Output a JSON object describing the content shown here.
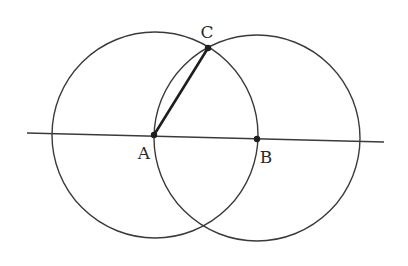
{
  "diagram": {
    "type": "geometric-construction",
    "stroke_color": "#3a3a3a",
    "background": "#ffffff",
    "line": {
      "x1": 27,
      "y1": 133,
      "x2": 384,
      "y2": 142
    },
    "circles": [
      {
        "name": "circle-centered-A",
        "cx": 155,
        "cy": 135,
        "r": 103
      },
      {
        "name": "circle-centered-B",
        "cx": 257,
        "cy": 138,
        "r": 103
      }
    ],
    "segments": [
      {
        "name": "segment-AC",
        "from": "A",
        "to": "C"
      }
    ],
    "points": {
      "A": {
        "x": 154,
        "y": 135,
        "label": "A",
        "label_x": 144,
        "label_y": 153
      },
      "B": {
        "x": 257,
        "y": 139,
        "label": "B",
        "label_x": 266,
        "label_y": 157
      },
      "C": {
        "x": 208,
        "y": 48,
        "label": "C",
        "label_x": 207,
        "label_y": 32
      }
    }
  }
}
